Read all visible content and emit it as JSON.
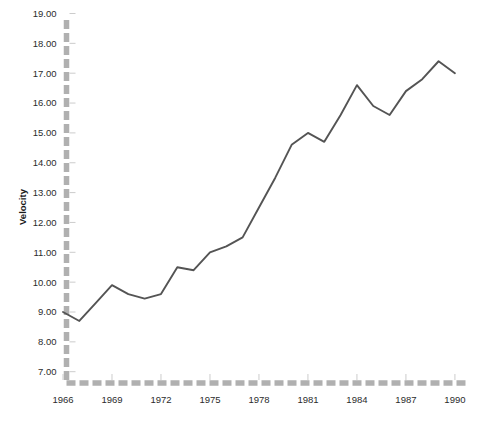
{
  "chart_data": {
    "type": "line",
    "title": "",
    "xlabel": "",
    "ylabel": "Velocity",
    "x": [
      1966,
      1967,
      1968,
      1969,
      1970,
      1971,
      1972,
      1973,
      1974,
      1975,
      1976,
      1977,
      1978,
      1979,
      1980,
      1981,
      1982,
      1983,
      1984,
      1985,
      1986,
      1987,
      1988,
      1989,
      1990
    ],
    "values": [
      9.0,
      8.7,
      9.3,
      9.9,
      9.6,
      9.45,
      9.6,
      10.5,
      10.4,
      11.0,
      11.2,
      11.5,
      12.5,
      13.5,
      14.6,
      15.0,
      14.7,
      15.6,
      16.6,
      15.9,
      15.6,
      16.4,
      16.8,
      17.4,
      17.0
    ],
    "series": [
      {
        "name": "Velocity",
        "values": [
          9.0,
          8.7,
          9.3,
          9.9,
          9.6,
          9.45,
          9.6,
          10.5,
          10.4,
          11.0,
          11.2,
          11.5,
          12.5,
          13.5,
          14.6,
          15.0,
          14.7,
          15.6,
          16.6,
          15.9,
          15.6,
          16.4,
          16.8,
          17.4,
          17.0
        ]
      }
    ],
    "xlim": [
      1965.2,
      1991.6
    ],
    "ylim": [
      6.45,
      19.75
    ],
    "x_tick_values": [
      1966,
      1969,
      1972,
      1975,
      1978,
      1981,
      1984,
      1987,
      1990
    ],
    "x_tick_labels": [
      "1966",
      "1969",
      "1972",
      "1975",
      "1978",
      "1981",
      "1984",
      "1987",
      "1990"
    ],
    "y_tick_values": [
      7,
      8,
      9,
      10,
      11,
      12,
      13,
      14,
      15,
      16,
      17,
      18,
      19
    ],
    "y_tick_labels": [
      "7.00",
      "8.00",
      "9.00",
      "10.00",
      "11.00",
      "12.00",
      "13.00",
      "14.00",
      "15.00",
      "16.00",
      "17.00",
      "18.00",
      "19.00"
    ],
    "grid": false,
    "legend": false,
    "legend_position": "none",
    "annotations": []
  },
  "style": {
    "line_color": "#545454",
    "axis_color": "#b0b0b0",
    "tick_mark_color": "#cccccc",
    "label_color": "#2b2b2b",
    "title_color": "#1a1a1a",
    "background": "#ffffff",
    "axis_dash_pattern": "9 4"
  },
  "axes": {
    "y_title": "Velocity",
    "x_title": ""
  }
}
